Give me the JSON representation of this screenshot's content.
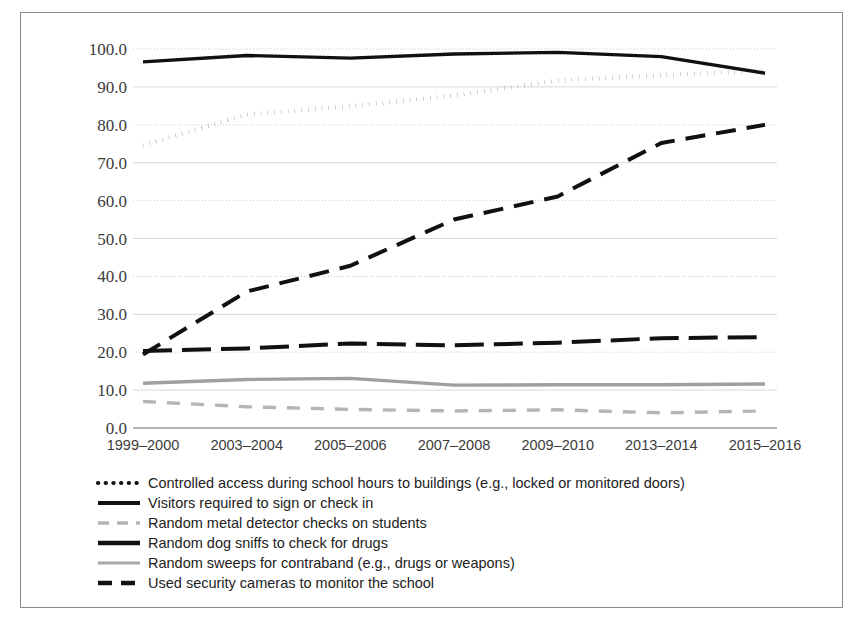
{
  "figure": {
    "frame_border_color": "#8a8a8a",
    "background_color": "#ffffff"
  },
  "chart_data": {
    "type": "line",
    "title": "",
    "subtitle": "",
    "xlabel": "",
    "ylabel": "",
    "ylim": [
      0,
      100
    ],
    "ytick_step": 10,
    "yticks": [
      "0.0",
      "10.0",
      "20.0",
      "30.0",
      "40.0",
      "50.0",
      "60.0",
      "70.0",
      "80.0",
      "90.0",
      "100.0"
    ],
    "grid": true,
    "grid_axis": "y",
    "legend_position": "below-left",
    "categories": [
      "1999–2000",
      "2003–2004",
      "2005–2006",
      "2007–2008",
      "2009–2010",
      "2013–2014",
      "2015–2016"
    ],
    "x": [
      1999,
      2003,
      2005,
      2007,
      2009,
      2013,
      2015
    ],
    "series": [
      {
        "name": "Controlled access during school hours to buildings (e.g., locked or monitored doors)",
        "values": [
          74.6,
          82.7,
          84.9,
          87.7,
          91.7,
          93.1,
          94.3
        ],
        "style": "dotted",
        "color": "#111111",
        "width": 4.2,
        "dasharray": "0.2 6.6",
        "linecap": "round"
      },
      {
        "name": "Visitors required to sign or check in",
        "values": [
          96.6,
          98.3,
          97.6,
          98.7,
          99.1,
          98.0,
          93.6
        ],
        "style": "solid",
        "color": "#111111",
        "width": 3.4,
        "dasharray": "none",
        "linecap": "butt"
      },
      {
        "name": "Random metal detector checks on students",
        "values": [
          7.0,
          5.6,
          4.9,
          4.5,
          4.8,
          4.0,
          4.5
        ],
        "style": "dashed",
        "color": "#b5b5b5",
        "width": 3.4,
        "dasharray": "13 11",
        "linecap": "butt"
      },
      {
        "name": "Random dog sniffs to check for drugs",
        "values": [
          20.3,
          21.0,
          22.3,
          21.8,
          22.5,
          23.7,
          24.0
        ],
        "style": "dashed-heavy",
        "color": "#111111",
        "width": 4.0,
        "dasharray": "29 10",
        "linecap": "butt"
      },
      {
        "name": "Random sweeps for contraband (e.g., drugs or weapons)",
        "values": [
          11.8,
          12.8,
          13.1,
          11.3,
          11.4,
          11.4,
          11.6
        ],
        "style": "solid",
        "color": "#9f9f9f",
        "width": 3.4,
        "dasharray": "none",
        "linecap": "butt"
      },
      {
        "name": "Used security cameras to monitor the school",
        "values": [
          19.4,
          36.0,
          42.8,
          55.0,
          61.1,
          75.2,
          80.0
        ],
        "style": "dashed-long",
        "color": "#111111",
        "width": 4.0,
        "dasharray": "20 11",
        "linecap": "butt"
      }
    ]
  },
  "legend": {
    "items": [
      {
        "label": "Controlled access during school hours to buildings (e.g., locked or monitored doors)",
        "swatch": "dotted-line-swatch",
        "color": "#111111",
        "width": 4.2,
        "dasharray": "0.2 7.5",
        "linecap": "round"
      },
      {
        "label": "Visitors required to sign or check in",
        "swatch": "solid-line-swatch",
        "color": "#111111",
        "width": 4.0,
        "dasharray": "none",
        "linecap": "butt"
      },
      {
        "label": "Random metal detector checks on students",
        "swatch": "dashed-gray-line-swatch",
        "color": "#b5b5b5",
        "width": 3.6,
        "dasharray": "11 8",
        "linecap": "butt"
      },
      {
        "label": "Random dog sniffs to check for drugs",
        "swatch": "solid-heavy-line-swatch",
        "color": "#111111",
        "width": 4.6,
        "dasharray": "none",
        "linecap": "butt"
      },
      {
        "label": "Random sweeps for contraband (e.g., drugs or weapons)",
        "swatch": "solid-gray-line-swatch",
        "color": "#a8a8a8",
        "width": 3.2,
        "dasharray": "none",
        "linecap": "butt"
      },
      {
        "label": "Used security cameras to monitor the school",
        "swatch": "dashed-black-line-swatch",
        "color": "#111111",
        "width": 4.4,
        "dasharray": "14 9",
        "linecap": "butt"
      }
    ]
  },
  "plot_geometry": {
    "left": 143,
    "right": 765,
    "top": 49,
    "bottom": 428
  },
  "legend_geometry": {
    "swatch_x1": 98,
    "swatch_x2": 140,
    "text_x": 148,
    "first_row_y": 483,
    "row_height": 20
  }
}
